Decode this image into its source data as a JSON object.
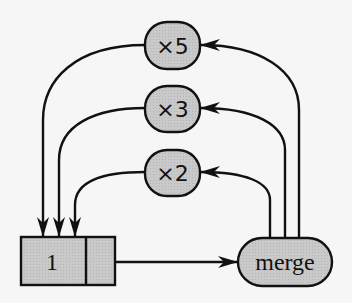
{
  "diagram": {
    "type": "dataflow",
    "nodes": {
      "times5": {
        "label": "×5"
      },
      "times3": {
        "label": "×3"
      },
      "times2": {
        "label": "×2"
      },
      "stream_cell": {
        "label": "1"
      },
      "merge": {
        "label": "merge"
      }
    },
    "edges": [
      {
        "from": "stream_cell",
        "to": "merge"
      },
      {
        "from": "merge",
        "to": "times2"
      },
      {
        "from": "merge",
        "to": "times3"
      },
      {
        "from": "merge",
        "to": "times5"
      },
      {
        "from": "times2",
        "to": "stream_cell"
      },
      {
        "from": "times3",
        "to": "stream_cell"
      },
      {
        "from": "times5",
        "to": "stream_cell"
      }
    ],
    "colors": {
      "node_fill": "#c8c8c8",
      "stroke": "#111111",
      "background": "#f6f6f6"
    }
  }
}
